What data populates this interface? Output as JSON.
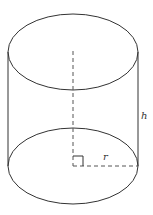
{
  "diagram": {
    "title": "",
    "shape": "cylinder",
    "stroke_color": "#333333",
    "dash_color": "#555555",
    "labels": {
      "height": "h",
      "radius": "r"
    },
    "geometry": {
      "center_x": 73,
      "radius_x": 65,
      "radius_y": 38,
      "top_center_y": 52,
      "bottom_center_y": 166,
      "axis_dash_start_y": 51,
      "right_angle_size": 10
    }
  }
}
